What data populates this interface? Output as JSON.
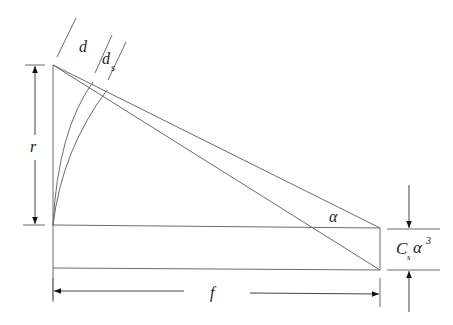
{
  "diagram": {
    "type": "geometric-dimension-drawing",
    "labels": {
      "d": "d",
      "ds_base": "d",
      "ds_sub": "s",
      "r": "r",
      "alpha": "α",
      "f": "f",
      "cs_base": "C",
      "cs_sub": "s",
      "cs_alpha": "α",
      "cs_exp": "3"
    },
    "colors": {
      "line": "#6b6b6b",
      "text": "#222222",
      "background": "#ffffff"
    }
  }
}
